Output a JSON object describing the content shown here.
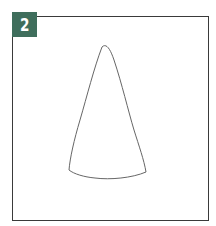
{
  "badge": {
    "number": "2",
    "color": "#3f6e5c"
  },
  "figure": {
    "shape": "cone-outline",
    "stroke_color": "#555555"
  }
}
